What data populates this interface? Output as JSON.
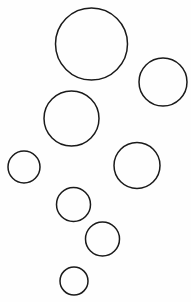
{
  "figure": {
    "background_color": "#fefefe",
    "stroke_color": "#1a1a1a",
    "stroke_width": 1.5,
    "fill": "none",
    "canvas": {
      "width": 191,
      "height": 302
    }
  },
  "chart_data": {
    "type": "scatter",
    "title": "",
    "subtitle": "",
    "xlabel": "",
    "ylabel": "",
    "xlim": [
      0,
      191
    ],
    "ylim": [
      0,
      302
    ],
    "grid": false,
    "legend": null,
    "marker": "open-circle",
    "count": 8,
    "points": [
      {
        "id": "circle-1",
        "label": "largest-top",
        "cx": 91.5,
        "cy": 44.0,
        "r": 36.0
      },
      {
        "id": "circle-2",
        "label": "upper-right",
        "cx": 163.0,
        "cy": 82.0,
        "r": 24.0
      },
      {
        "id": "circle-3",
        "label": "middle-left",
        "cx": 71.5,
        "cy": 118.5,
        "r": 27.5
      },
      {
        "id": "circle-4",
        "label": "far-left-small",
        "cx": 24.0,
        "cy": 167.0,
        "r": 16.0
      },
      {
        "id": "circle-5",
        "label": "middle-right",
        "cx": 137.0,
        "cy": 165.5,
        "r": 23.0
      },
      {
        "id": "circle-6",
        "label": "center-small",
        "cx": 73.5,
        "cy": 204.5,
        "r": 17.0
      },
      {
        "id": "circle-7",
        "label": "lower-center-small",
        "cx": 102.5,
        "cy": 239.0,
        "r": 17.0
      },
      {
        "id": "circle-8",
        "label": "smallest-bottom",
        "cx": 74.0,
        "cy": 281.0,
        "r": 14.0
      }
    ]
  }
}
